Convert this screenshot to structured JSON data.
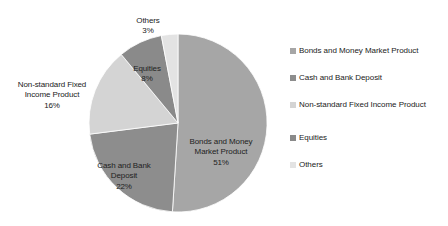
{
  "chart_data": {
    "type": "pie",
    "title": "",
    "subtitle": "",
    "xlabel": "",
    "ylabel": "",
    "grid": false,
    "legend_position": "right",
    "categories": [
      "Bonds and Money Market Product",
      "Cash and Bank Deposit",
      "Non-standard Fixed Income Product",
      "Equities",
      "Others"
    ],
    "values": [
      51,
      22,
      16,
      8,
      3
    ],
    "value_unit": "%",
    "start_angle_deg": 0,
    "direction": "clockwise",
    "slices": [
      {
        "label": "Bonds and Money Market Product",
        "value": 51,
        "value_text": "51%",
        "color": "#a6a6a6",
        "label_line1": "Bonds and Money",
        "label_line2": "Market Product"
      },
      {
        "label": "Cash and Bank Deposit",
        "value": 22,
        "value_text": "22%",
        "color": "#8d8d8d",
        "label_line1": "Cash and Bank",
        "label_line2": "Deposit"
      },
      {
        "label": "Non-standard Fixed Income Product",
        "value": 16,
        "value_text": "16%",
        "color": "#d4d4d4",
        "label_line1": "Non-standard Fixed",
        "label_line2": "Income Product"
      },
      {
        "label": "Equities",
        "value": 8,
        "value_text": "8%",
        "color": "#8a8a8a",
        "label_line1": "Equities",
        "label_line2": ""
      },
      {
        "label": "Others",
        "value": 3,
        "value_text": "3%",
        "color": "#e3e3e3",
        "label_line1": "Others",
        "label_line2": ""
      }
    ]
  },
  "legend": {
    "items": [
      {
        "label": "Bonds and Money Market Product",
        "color": "#a6a6a6"
      },
      {
        "label": "Cash and Bank Deposit",
        "color": "#8d8d8d"
      },
      {
        "label": "Non-standard Fixed Income Product",
        "color": "#d4d4d4"
      },
      {
        "label": "Equities",
        "color": "#8a8a8a"
      },
      {
        "label": "Others",
        "color": "#e3e3e3"
      }
    ]
  },
  "labels": {
    "others": {
      "name": "Others",
      "pct": "3%"
    },
    "equities": {
      "name": "Equities",
      "pct": "8%"
    },
    "nonstandard": {
      "name": "Non-standard Fixed\nIncome Product",
      "pct": "16%"
    },
    "cash": {
      "name": "Cash and Bank\nDeposit",
      "pct": "22%"
    },
    "bonds": {
      "name": "Bonds and Money\nMarket Product",
      "pct": "51%"
    }
  },
  "colors": {
    "background": "#ffffff",
    "text": "#222222",
    "slice_bonds": "#a6a6a6",
    "slice_cash": "#8d8d8d",
    "slice_nonstandard": "#d4d4d4",
    "slice_equities": "#8a8a8a",
    "slice_others": "#e3e3e3"
  }
}
